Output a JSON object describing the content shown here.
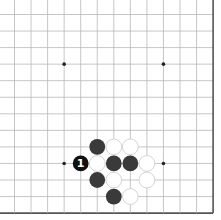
{
  "board": {
    "columns": 13,
    "rows": 13,
    "origin_x": 14.5,
    "origin_y": 14.5,
    "spacing": 16.55,
    "edges": {
      "top": false,
      "left": false,
      "right": true,
      "bottom": true
    },
    "line_color": "#b8b8b8",
    "edge_color": "#555555",
    "background": "#ffffff",
    "star_points": [
      [
        3,
        3
      ],
      [
        9,
        3
      ],
      [
        3,
        9
      ],
      [
        9,
        9
      ]
    ]
  },
  "stones": [
    {
      "col": 5,
      "row": 8,
      "color": "black",
      "label": ""
    },
    {
      "col": 6,
      "row": 8,
      "color": "white",
      "label": ""
    },
    {
      "col": 7,
      "row": 8,
      "color": "white",
      "label": ""
    },
    {
      "col": 4,
      "row": 9,
      "color": "black",
      "label": "1"
    },
    {
      "col": 5,
      "row": 9,
      "color": "white",
      "label": ""
    },
    {
      "col": 6,
      "row": 9,
      "color": "black",
      "label": ""
    },
    {
      "col": 7,
      "row": 9,
      "color": "black",
      "label": ""
    },
    {
      "col": 8,
      "row": 9,
      "color": "white",
      "label": ""
    },
    {
      "col": 5,
      "row": 10,
      "color": "black",
      "label": ""
    },
    {
      "col": 6,
      "row": 10,
      "color": "white",
      "label": ""
    },
    {
      "col": 8,
      "row": 10,
      "color": "white",
      "label": ""
    },
    {
      "col": 6,
      "row": 11,
      "color": "black",
      "label": ""
    },
    {
      "col": 7,
      "row": 11,
      "color": "white",
      "label": ""
    }
  ],
  "colors": {
    "black_stone": "#3a3a3a",
    "black_labeled_stone": "#111111",
    "white_stone": "#ffffff",
    "white_stone_border": "#cfcfcf",
    "label_color": "#ffffff"
  }
}
